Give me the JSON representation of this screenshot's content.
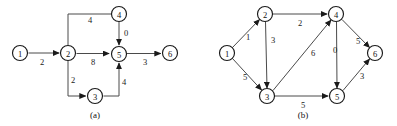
{
  "figure": {
    "panels": [
      {
        "id": "a",
        "caption": "(a)",
        "caption_pos": {
          "x": 95,
          "y": 115
        },
        "nodes": [
          {
            "id": "n1",
            "label": "1",
            "x": 20,
            "y": 53
          },
          {
            "id": "n2",
            "label": "2",
            "x": 68,
            "y": 53
          },
          {
            "id": "n3",
            "label": "3",
            "x": 95,
            "y": 96
          },
          {
            "id": "n4",
            "label": "4",
            "x": 119,
            "y": 14
          },
          {
            "id": "n5",
            "label": "5",
            "x": 119,
            "y": 54
          },
          {
            "id": "n6",
            "label": "6",
            "x": 170,
            "y": 53
          }
        ],
        "node_radius": 7.5,
        "edges": [
          {
            "id": "a-e1",
            "from": "1",
            "to": "2",
            "weight": "2",
            "label_pos": {
              "x": 42,
              "y": 62
            },
            "arrow": true,
            "path": "M 28.5 53 L 59 53"
          },
          {
            "id": "a-e2",
            "from": "2",
            "to": "5",
            "weight": "8",
            "label_pos": {
              "x": 93,
              "y": 62
            },
            "arrow": true,
            "path": "M 76.5 53.5 L 109 53.5"
          },
          {
            "id": "a-e3",
            "from": "5",
            "to": "6",
            "weight": "3",
            "label_pos": {
              "x": 145,
              "y": 62
            },
            "arrow": true,
            "path": "M 127 53.5 L 160.5 53.5"
          },
          {
            "id": "a-e4",
            "from": "4",
            "to": "2",
            "weight": "4",
            "label_pos": {
              "x": 90,
              "y": 20
            },
            "arrow": false,
            "path": "M 111.5 14 L 68 14 L 68 45.5"
          },
          {
            "id": "a-e5",
            "from": "4",
            "to": "5",
            "weight": "0",
            "label_pos": {
              "x": 126,
              "y": 33
            },
            "arrow": true,
            "path": "M 119 21.5 L 119 45"
          },
          {
            "id": "a-e6",
            "from": "2",
            "to": "3",
            "weight": "2",
            "label_pos": {
              "x": 73,
              "y": 80
            },
            "arrow": true,
            "path": "M 68 61 L 68 96 L 85.5 96"
          },
          {
            "id": "a-e7",
            "from": "3",
            "to": "5",
            "weight": "4",
            "label_pos": {
              "x": 124,
              "y": 82
            },
            "arrow": true,
            "path": "M 103.5 96 L 119 96 L 119 63"
          }
        ]
      },
      {
        "id": "b",
        "caption": "(b)",
        "caption_pos": {
          "x": 303,
          "y": 115
        },
        "nodes": [
          {
            "id": "n1",
            "label": "1",
            "x": 227,
            "y": 53
          },
          {
            "id": "n2",
            "label": "2",
            "x": 265,
            "y": 14
          },
          {
            "id": "n3",
            "label": "3",
            "x": 267,
            "y": 96
          },
          {
            "id": "n4",
            "label": "4",
            "x": 336,
            "y": 14
          },
          {
            "id": "n5",
            "label": "5",
            "x": 337,
            "y": 96
          },
          {
            "id": "n6",
            "label": "6",
            "x": 375,
            "y": 53
          }
        ],
        "node_radius": 7.5,
        "edges": [
          {
            "id": "b-e1",
            "from": "1",
            "to": "2",
            "weight": "1",
            "label_pos": {
              "x": 248,
              "y": 37
            },
            "arrow": true,
            "path": "M 232.5 47.5 L 259.5 19.5"
          },
          {
            "id": "b-e2",
            "from": "1",
            "to": "3",
            "weight": "5",
            "label_pos": {
              "x": 245,
              "y": 77
            },
            "arrow": true,
            "path": "M 232.5 58.5 L 261.5 90"
          },
          {
            "id": "b-e3",
            "from": "2",
            "to": "4",
            "weight": "2",
            "label_pos": {
              "x": 300,
              "y": 23
            },
            "arrow": true,
            "path": "M 273 14 L 327 14"
          },
          {
            "id": "b-e4",
            "from": "2",
            "to": "3",
            "weight": "3",
            "label_pos": {
              "x": 273,
              "y": 40
            },
            "arrow": true,
            "path": "M 265.5 21.5 L 267 88"
          },
          {
            "id": "b-e5",
            "from": "3",
            "to": "4",
            "weight": "6",
            "label_pos": {
              "x": 313,
              "y": 53
            },
            "arrow": true,
            "path": "M 273 90.5 L 331 20"
          },
          {
            "id": "b-e6",
            "from": "4",
            "to": "5",
            "weight": "0",
            "label_pos": {
              "x": 335,
              "y": 50
            },
            "arrow": true,
            "path": "M 336.5 21.5 L 337 88"
          },
          {
            "id": "b-e7",
            "from": "4",
            "to": "6",
            "weight": "5",
            "label_pos": {
              "x": 358,
              "y": 41
            },
            "arrow": true,
            "path": "M 342 19.5 L 369.5 47.5"
          },
          {
            "id": "b-e8",
            "from": "3",
            "to": "5",
            "weight": "5",
            "label_pos": {
              "x": 303,
              "y": 105
            },
            "arrow": true,
            "path": "M 275 96 L 328 96"
          },
          {
            "id": "b-e9",
            "from": "5",
            "to": "6",
            "weight": "3",
            "label_pos": {
              "x": 362,
              "y": 76
            },
            "arrow": true,
            "path": "M 343 90.5 L 369.5 59"
          }
        ]
      }
    ]
  },
  "colors": {
    "node_stroke": "#1a1a1a",
    "node_fill": "#ffffff",
    "edge_stroke": "#4a4a4a",
    "text": "#111111",
    "background": "#ffffff"
  }
}
